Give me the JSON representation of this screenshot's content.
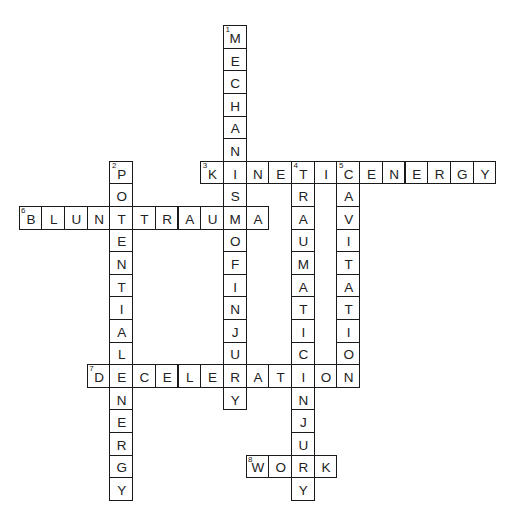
{
  "puzzle": {
    "type": "crossword",
    "grid": {
      "origin_x": 18.6,
      "origin_y": 25.2,
      "cell": 22.7,
      "cell_h": 22.6
    },
    "entries": [
      {
        "number": "1",
        "answer": "MECHANISMOFINJURY",
        "direction": "down",
        "row": 0,
        "col": 9
      },
      {
        "number": "2",
        "answer": "POTENTIALENERGY",
        "direction": "down",
        "row": 6,
        "col": 4
      },
      {
        "number": "3",
        "answer": "KINETICENERGY",
        "direction": "across",
        "row": 6,
        "col": 8
      },
      {
        "number": "4",
        "answer": "TRAUMATICINJURY",
        "direction": "down",
        "row": 6,
        "col": 12
      },
      {
        "number": "5",
        "answer": "CAVITATION",
        "direction": "down",
        "row": 6,
        "col": 14
      },
      {
        "number": "6",
        "answer": "BLUNTTRAUMA",
        "direction": "across",
        "row": 8,
        "col": 0
      },
      {
        "number": "7",
        "answer": "DECELERATION",
        "direction": "across",
        "row": 15,
        "col": 3
      },
      {
        "number": "8",
        "answer": "WORK",
        "direction": "across",
        "row": 19,
        "col": 10
      }
    ]
  }
}
